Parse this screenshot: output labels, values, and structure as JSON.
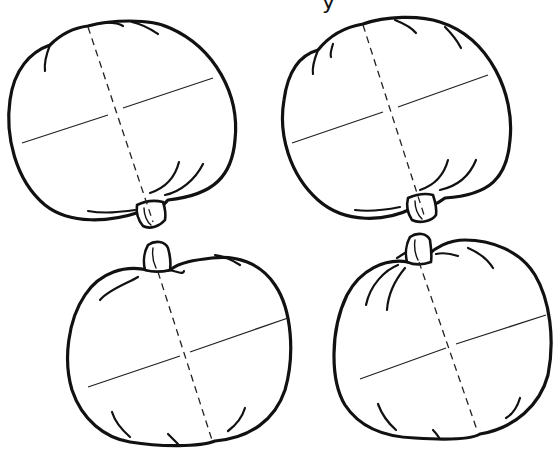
{
  "page": {
    "type": "worksheet-illustration",
    "background_color": "#ffffff",
    "line_color": "#111111"
  },
  "header": {
    "cutoff_text": "y"
  },
  "pumpkins": [
    {
      "id": 1,
      "position": "top-left",
      "orientation": "upside-down",
      "sections": 4
    },
    {
      "id": 2,
      "position": "top-right",
      "orientation": "upside-down",
      "sections": 4
    },
    {
      "id": 3,
      "position": "bottom-left",
      "orientation": "upright",
      "sections": 4
    },
    {
      "id": 4,
      "position": "bottom-right",
      "orientation": "upright",
      "sections": 4
    }
  ],
  "divider_styles": {
    "vertical": "dashed",
    "horizontal": "solid"
  }
}
